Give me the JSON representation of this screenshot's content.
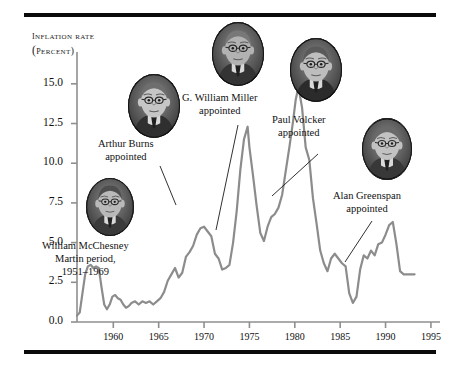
{
  "figure": {
    "axis_title_lines": [
      "INFLATION RATE",
      "(PERCENT)"
    ],
    "line_color": "#8c8c8c",
    "axis_color": "#8f8f8f",
    "rule_color": "#0a0a0a"
  },
  "callouts": [
    {
      "id": "martin",
      "lines": [
        "William McChesney",
        "Martin period,",
        "1951–1969"
      ]
    },
    {
      "id": "burns",
      "lines": [
        "Arthur Burns",
        "appointed"
      ]
    },
    {
      "id": "miller",
      "lines": [
        "G. William Miller",
        "appointed"
      ]
    },
    {
      "id": "volcker",
      "lines": [
        "Paul Volcker",
        "appointed"
      ]
    },
    {
      "id": "greenspan",
      "lines": [
        "Alan Greenspan",
        "appointed"
      ]
    }
  ],
  "portraits": [
    {
      "id": "martin-portrait",
      "name": "William McChesney Martin"
    },
    {
      "id": "burns-portrait",
      "name": "Arthur Burns"
    },
    {
      "id": "miller-portrait",
      "name": "G. William Miller"
    },
    {
      "id": "volcker-portrait",
      "name": "Paul Volcker"
    },
    {
      "id": "greenspan-portrait",
      "name": "Alan Greenspan"
    }
  ],
  "chart_data": {
    "type": "line",
    "title": "",
    "xlabel": "",
    "ylabel": "INFLATION RATE (PERCENT)",
    "xlim": [
      1956,
      1996
    ],
    "ylim": [
      0,
      16.5
    ],
    "grid": false,
    "legend": "none",
    "xticks": [
      1960,
      1965,
      1970,
      1975,
      1980,
      1985,
      1990,
      1995
    ],
    "yticks": [
      0.0,
      2.5,
      5.0,
      7.5,
      10.0,
      12.5,
      15.0
    ],
    "ytick_labels": [
      "0.0",
      "2.5",
      "5.0",
      "7.5",
      "10.0",
      "12.5",
      "15.0"
    ],
    "xtick_labels": [
      "1960",
      "1965",
      "1970",
      "1975",
      "1980",
      "1985",
      "1990",
      "1995"
    ],
    "series": [
      {
        "name": "Inflation rate",
        "x": [
          1956.0,
          1956.3,
          1956.6,
          1956.9,
          1957.2,
          1957.5,
          1957.8,
          1958.1,
          1958.4,
          1958.7,
          1959.0,
          1959.3,
          1959.6,
          1959.9,
          1960.2,
          1960.5,
          1960.8,
          1961.1,
          1961.4,
          1961.7,
          1962.0,
          1962.4,
          1962.8,
          1963.2,
          1963.6,
          1964.0,
          1964.4,
          1964.8,
          1965.2,
          1965.6,
          1966.0,
          1966.4,
          1966.8,
          1967.2,
          1967.6,
          1968.0,
          1968.4,
          1968.8,
          1969.2,
          1969.6,
          1970.0,
          1970.4,
          1970.8,
          1971.2,
          1971.6,
          1972.0,
          1972.4,
          1972.8,
          1973.2,
          1973.6,
          1974.0,
          1974.4,
          1974.8,
          1975.0,
          1975.4,
          1975.8,
          1976.2,
          1976.6,
          1977.0,
          1977.4,
          1977.8,
          1978.2,
          1978.6,
          1979.0,
          1979.4,
          1979.8,
          1980.1,
          1980.4,
          1980.8,
          1981.2,
          1981.6,
          1982.0,
          1982.4,
          1982.8,
          1983.2,
          1983.6,
          1984.0,
          1984.4,
          1984.8,
          1985.2,
          1985.6,
          1986.0,
          1986.4,
          1986.8,
          1987.2,
          1987.6,
          1988.0,
          1988.4,
          1988.8,
          1989.2,
          1989.6,
          1990.0,
          1990.4,
          1990.8,
          1991.2,
          1991.6,
          1992.0,
          1992.4,
          1992.8,
          1993.2
        ],
        "y": [
          0.4,
          0.6,
          1.8,
          3.0,
          3.5,
          3.6,
          3.4,
          3.5,
          3.4,
          2.2,
          1.1,
          0.8,
          1.1,
          1.6,
          1.7,
          1.5,
          1.4,
          1.1,
          0.9,
          1.0,
          1.2,
          1.3,
          1.1,
          1.3,
          1.2,
          1.3,
          1.1,
          1.3,
          1.5,
          1.9,
          2.6,
          3.0,
          3.4,
          2.8,
          3.1,
          4.1,
          4.4,
          4.8,
          5.5,
          5.9,
          6.0,
          5.7,
          5.4,
          4.3,
          4.0,
          3.3,
          3.4,
          3.6,
          5.0,
          7.0,
          9.6,
          11.5,
          12.3,
          11.0,
          9.2,
          7.3,
          5.6,
          5.1,
          6.0,
          6.6,
          6.8,
          7.2,
          8.0,
          9.5,
          11.0,
          12.6,
          14.0,
          14.8,
          13.5,
          11.0,
          10.2,
          7.8,
          6.2,
          4.5,
          3.7,
          3.2,
          4.0,
          4.3,
          4.0,
          3.7,
          3.5,
          1.8,
          1.2,
          1.6,
          3.3,
          4.2,
          4.0,
          4.5,
          4.2,
          4.9,
          5.0,
          5.5,
          6.1,
          6.3,
          4.9,
          3.2,
          3.0,
          3.0,
          3.0,
          3.0
        ]
      }
    ]
  }
}
